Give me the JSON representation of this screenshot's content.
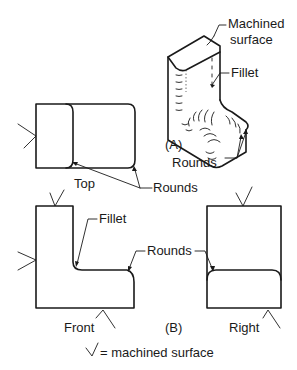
{
  "figure": {
    "part_a": {
      "caption": "(A)",
      "labels": {
        "machined_line1": "Machined",
        "machined_line2": "surface",
        "fillet": "Fillet",
        "rounds": "Rounds"
      }
    },
    "part_b": {
      "caption": "(B)",
      "views": {
        "top": "Top",
        "front": "Front",
        "right": "Right"
      },
      "labels": {
        "fillet": "Fillet",
        "rounds_top": "Rounds",
        "rounds_front_right": "Rounds"
      }
    },
    "legend": {
      "symbol": "check-mark-symbol",
      "text": "= machined surface"
    },
    "colors": {
      "line": "#1a1a1a",
      "background": "#ffffff"
    }
  }
}
